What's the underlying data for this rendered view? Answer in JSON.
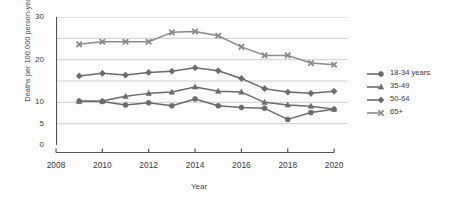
{
  "chart_data": {
    "type": "line",
    "title": "",
    "xlabel": "Year",
    "ylabel": "Deaths per 100,000 person-years",
    "x": [
      2009,
      2010,
      2011,
      2012,
      2013,
      2014,
      2015,
      2016,
      2017,
      2018,
      2019,
      2020
    ],
    "xlim": [
      2008,
      2020.6
    ],
    "ylim": [
      0,
      30
    ],
    "xticks": [
      2008,
      2010,
      2012,
      2014,
      2016,
      2018,
      2020
    ],
    "xticklabels": [
      "2008",
      "2010",
      "2012",
      "2014",
      "2016",
      "2018",
      "2020"
    ],
    "yticks": [
      0,
      5,
      10,
      15,
      20,
      25,
      30
    ],
    "yticklabels": [
      "0",
      "5",
      "10",
      "",
      "20",
      "",
      "30"
    ],
    "grid": true,
    "grid_axis": "y",
    "legend_position": "right",
    "series": [
      {
        "name": "18-34 years",
        "marker": "circle",
        "color": "#6b6b6b",
        "values": [
          10.3,
          10.2,
          9.4,
          9.9,
          9.2,
          10.8,
          9.2,
          8.8,
          8.6,
          6.0,
          7.6,
          8.4
        ]
      },
      {
        "name": "35-49",
        "marker": "triangle",
        "color": "#6b6b6b",
        "values": [
          10.2,
          10.3,
          11.4,
          12.1,
          12.4,
          13.6,
          12.6,
          12.4,
          10.0,
          9.4,
          9.1,
          8.4
        ]
      },
      {
        "name": "50-64",
        "marker": "diamond",
        "color": "#6b6b6b",
        "values": [
          16.2,
          16.8,
          16.4,
          17.0,
          17.3,
          18.1,
          17.4,
          15.6,
          13.2,
          12.4,
          12.1,
          12.6
        ]
      },
      {
        "name": "65+",
        "marker": "x",
        "color": "#8a8a8a",
        "values": [
          23.6,
          24.2,
          24.2,
          24.2,
          26.4,
          26.6,
          25.6,
          23.0,
          21.0,
          21.0,
          19.2,
          18.8
        ]
      }
    ]
  },
  "axes": {
    "y_title": "Deaths per 100,000 person-years",
    "x_title": "Year"
  },
  "legend": {
    "items": [
      {
        "label": "18-34 years"
      },
      {
        "label": "35-49"
      },
      {
        "label": "50-64"
      },
      {
        "label": "65+"
      }
    ]
  }
}
